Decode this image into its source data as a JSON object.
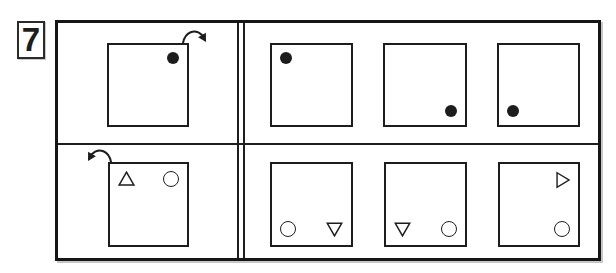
{
  "item_number": "7",
  "colors": {
    "ink": "#1d1d1d",
    "background": "#ffffff"
  },
  "puzzle": {
    "type": "visual-analogy-test-item",
    "rows": [
      {
        "stimulus": {
          "arrow": "clockwise",
          "shapes": [
            {
              "type": "filled-dot",
              "position": "top-right"
            }
          ]
        },
        "options": [
          {
            "shapes": [
              {
                "type": "filled-dot",
                "position": "top-left"
              }
            ]
          },
          {
            "shapes": [
              {
                "type": "filled-dot",
                "position": "bottom-right"
              }
            ]
          },
          {
            "shapes": [
              {
                "type": "filled-dot",
                "position": "bottom-left"
              }
            ]
          }
        ]
      },
      {
        "stimulus": {
          "arrow": "counterclockwise",
          "shapes": [
            {
              "type": "triangle-up",
              "position": "top-left"
            },
            {
              "type": "circle",
              "position": "top-right"
            }
          ]
        },
        "options": [
          {
            "shapes": [
              {
                "type": "circle",
                "position": "bottom-left"
              },
              {
                "type": "triangle-down",
                "position": "bottom-right"
              }
            ]
          },
          {
            "shapes": [
              {
                "type": "triangle-down",
                "position": "bottom-left"
              },
              {
                "type": "circle",
                "position": "bottom-right"
              }
            ]
          },
          {
            "shapes": [
              {
                "type": "triangle-right",
                "position": "top-right"
              },
              {
                "type": "circle",
                "position": "bottom-right"
              }
            ]
          }
        ]
      }
    ]
  }
}
